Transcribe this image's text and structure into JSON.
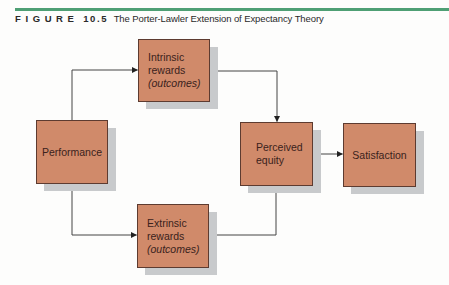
{
  "figure": {
    "label": "FIGURE",
    "number": "10.5",
    "title": "The Porter-Lawler Extension of Expectancy Theory",
    "rule_color": "#4e9f74"
  },
  "colors": {
    "node_fill": "#d08a6a",
    "node_border": "#5d3b30",
    "node_shadow": "#c8cacc",
    "connector": "#333333"
  },
  "nodes": {
    "performance": {
      "lines": [
        "Performance"
      ]
    },
    "intrinsic": {
      "lines": [
        "Intrinsic",
        "rewards",
        "(outcomes)"
      ]
    },
    "extrinsic": {
      "lines": [
        "Extrinsic",
        "rewards",
        "(outcomes)"
      ]
    },
    "perceived_equity": {
      "lines": [
        "Perceived",
        "equity"
      ]
    },
    "satisfaction": {
      "lines": [
        "Satisfaction"
      ]
    }
  },
  "edges": [
    {
      "from": "Performance",
      "to": "Intrinsic rewards (outcomes)"
    },
    {
      "from": "Performance",
      "to": "Extrinsic rewards (outcomes)"
    },
    {
      "from": "Intrinsic rewards (outcomes)",
      "to": "Perceived equity"
    },
    {
      "from": "Extrinsic rewards (outcomes)",
      "to": "Perceived equity"
    },
    {
      "from": "Perceived equity",
      "to": "Satisfaction"
    }
  ]
}
